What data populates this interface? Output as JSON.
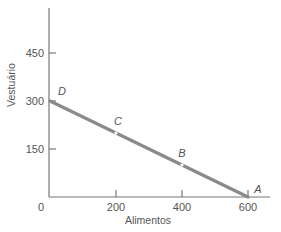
{
  "chart_data": {
    "type": "line",
    "title": "",
    "xlabel": "Alimentos",
    "ylabel": "Vestuário",
    "xlim": [
      0,
      660
    ],
    "ylim": [
      0,
      590
    ],
    "x_ticks": [
      200,
      400,
      600
    ],
    "x_tick_labels": [
      "200",
      "400",
      "600"
    ],
    "y_ticks": [
      150,
      300,
      450
    ],
    "y_tick_labels": [
      "150",
      "300",
      "450"
    ],
    "origin_label": "0",
    "grid": false,
    "series": [
      {
        "name": "budget-line",
        "x": [
          0,
          600
        ],
        "y": [
          300,
          0
        ],
        "color": "#8a8a8a"
      }
    ],
    "points": [
      {
        "label": "D",
        "x": 0,
        "y": 300
      },
      {
        "label": "C",
        "x": 200,
        "y": 200
      },
      {
        "label": "B",
        "x": 400,
        "y": 100
      },
      {
        "label": "A",
        "x": 600,
        "y": 0
      }
    ]
  }
}
